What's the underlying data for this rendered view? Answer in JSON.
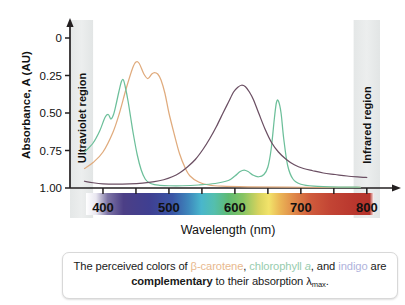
{
  "figure": {
    "title": "",
    "axis": {
      "ylabel": "Absorbance, A (AU)",
      "xlabel": "Wavelength (nm)",
      "yticks": [
        "1.00",
        "0.75",
        "0.50",
        "0.25",
        "0"
      ],
      "xticks": [
        "400",
        "500",
        "600",
        "700",
        "800"
      ]
    },
    "regions": {
      "uv_label": "Ultraviolet region",
      "ir_label": "Infrared region"
    }
  },
  "caption": {
    "part1": "The perceived colors of ",
    "species1": "β-carotene",
    "sep1": ", ",
    "species2_pre": "chlorophyll ",
    "species2_ital": "a",
    "sep2": ", and ",
    "species3": "indigo",
    "part2": " are ",
    "emphasis": "complementary",
    "part3": " to their absorption λ",
    "sub": "max",
    "part4": "."
  },
  "colors": {
    "carotene": "#e0ab7d",
    "chlorophyll": "#6cbf9a",
    "indigo": "#6b4f63",
    "uv_band": "#e6e8e8",
    "ir_band": "#e6e8e8",
    "axis": "#231f20",
    "caption_carotene": "#e8b98e",
    "caption_chlorophyll": "#97ccae",
    "caption_indigo": "#b0b3dc"
  },
  "chart_data": {
    "type": "line",
    "title": "",
    "xlabel": "Wavelength (nm)",
    "ylabel": "Absorbance, A (AU)",
    "xlim": [
      350,
      820
    ],
    "ylim": [
      0,
      1.1
    ],
    "yticks": [
      0,
      0.25,
      0.5,
      0.75,
      1.0
    ],
    "xticks": [
      400,
      450,
      500,
      550,
      600,
      650,
      700,
      750,
      800
    ],
    "xtick_labels": [
      "400",
      "",
      "500",
      "",
      "600",
      "",
      "700",
      "",
      "800"
    ],
    "grid": false,
    "legend": "none",
    "annotations": [
      "Ultraviolet region",
      "Infrared region"
    ],
    "shaded_regions": [
      {
        "name": "Ultraviolet region",
        "x0": 350,
        "x1": 385
      },
      {
        "name": "Infrared region",
        "x0": 780,
        "x1": 820
      }
    ],
    "series": [
      {
        "name": "β-carotene",
        "color": "#e0ab7d",
        "lambda_max": 450,
        "x": [
          372,
          385,
          400,
          415,
          425,
          435,
          445,
          450,
          455,
          462,
          468,
          474,
          478,
          483,
          488,
          494,
          500,
          508,
          516,
          524,
          532,
          545,
          560,
          580,
          620,
          700,
          790
        ],
        "y": [
          0.13,
          0.17,
          0.24,
          0.37,
          0.5,
          0.66,
          0.8,
          0.84,
          0.83,
          0.76,
          0.73,
          0.76,
          0.77,
          0.76,
          0.72,
          0.63,
          0.5,
          0.36,
          0.23,
          0.14,
          0.08,
          0.04,
          0.02,
          0.012,
          0.008,
          0.005,
          0.004
        ]
      },
      {
        "name": "chlorophyll a",
        "color": "#6cbf9a",
        "lambda_max": 430,
        "x": [
          372,
          385,
          395,
          403,
          408,
          412,
          416,
          420,
          424,
          428,
          431,
          434,
          438,
          442,
          446,
          452,
          458,
          464,
          470,
          478,
          486,
          500,
          520,
          545,
          570,
          590,
          600,
          608,
          614,
          620,
          628,
          636,
          644,
          650,
          655,
          660,
          663,
          666,
          670,
          674,
          680,
          688,
          700,
          720,
          760,
          790
        ],
        "y": [
          0.24,
          0.3,
          0.38,
          0.47,
          0.49,
          0.46,
          0.49,
          0.56,
          0.64,
          0.71,
          0.72,
          0.67,
          0.58,
          0.47,
          0.36,
          0.22,
          0.12,
          0.06,
          0.035,
          0.022,
          0.018,
          0.015,
          0.015,
          0.02,
          0.03,
          0.05,
          0.08,
          0.11,
          0.12,
          0.11,
          0.085,
          0.075,
          0.09,
          0.14,
          0.26,
          0.47,
          0.57,
          0.58,
          0.5,
          0.33,
          0.15,
          0.06,
          0.025,
          0.012,
          0.006,
          0.005
        ]
      },
      {
        "name": "indigo",
        "color": "#6b4f63",
        "lambda_max": 610,
        "x": [
          372,
          385,
          400,
          420,
          440,
          460,
          478,
          492,
          505,
          516,
          528,
          540,
          552,
          562,
          572,
          582,
          590,
          598,
          604,
          610,
          616,
          622,
          628,
          636,
          646,
          656,
          666,
          678,
          690,
          704,
          718,
          734,
          752,
          770,
          790,
          800
        ],
        "y": [
          0.045,
          0.035,
          0.028,
          0.026,
          0.028,
          0.033,
          0.042,
          0.055,
          0.075,
          0.1,
          0.14,
          0.19,
          0.26,
          0.33,
          0.41,
          0.5,
          0.57,
          0.64,
          0.67,
          0.685,
          0.675,
          0.64,
          0.59,
          0.5,
          0.39,
          0.3,
          0.24,
          0.19,
          0.155,
          0.13,
          0.115,
          0.1,
          0.09,
          0.08,
          0.073,
          0.07
        ]
      }
    ]
  }
}
